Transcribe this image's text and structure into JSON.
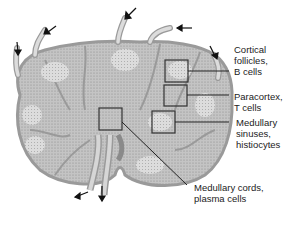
{
  "diagram": {
    "colors": {
      "tissue": "#bdbdbd",
      "capsule": "#9a9a9a",
      "vessel": "#d6d6d6",
      "follicle": "#d0d0d0",
      "line": "#222222",
      "background": "#ffffff"
    },
    "labels": [
      {
        "id": "cortical-follicles",
        "text1": "Cortical",
        "text2": "follicles,",
        "text3": "B cells"
      },
      {
        "id": "paracortex",
        "text1": "Paracortex,",
        "text2": "T cells"
      },
      {
        "id": "medullary-sinuses",
        "text1": "Medullary",
        "text2": "sinuses,",
        "text3": "histiocytes"
      },
      {
        "id": "medullary-cords",
        "text1": "Medullary cords,",
        "text2": "plasma cells"
      }
    ],
    "arrows": {
      "afferent_count": 6,
      "efferent_count": 2
    }
  }
}
